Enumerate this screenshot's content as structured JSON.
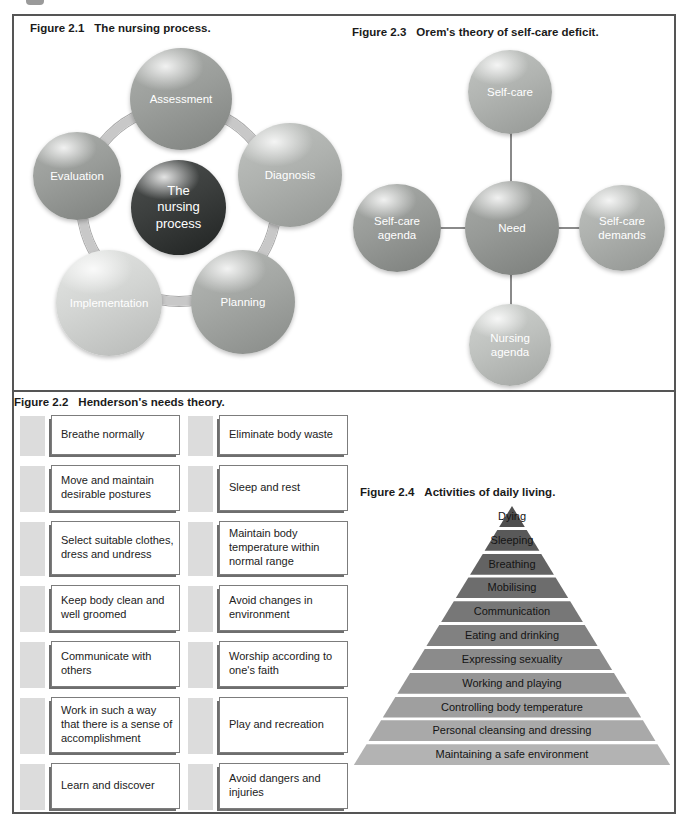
{
  "fig21": {
    "label": "Figure 2.1",
    "title": "The nursing process.",
    "ring_color": "#c8c8c8",
    "center": {
      "text": "The nursing process",
      "color": "#3c3f3e"
    },
    "nodes": [
      {
        "text": "Assessment",
        "color": "#9b9e9b"
      },
      {
        "text": "Evaluation",
        "color": "#9a9d9a"
      },
      {
        "text": "Diagnosis",
        "color": "#afb2af"
      },
      {
        "text": "Implementation",
        "color": "#d3d5d3"
      },
      {
        "text": "Planning",
        "color": "#a4a7a4"
      }
    ]
  },
  "fig23": {
    "label": "Figure 2.3",
    "title": "Orem's theory of self-care deficit.",
    "nodes": [
      {
        "text": "Self-care",
        "color": "#b1b4b1"
      },
      {
        "text": "Self-care agenda",
        "color": "#989b98"
      },
      {
        "text": "Need",
        "color": "#979a97"
      },
      {
        "text": "Self-care demands",
        "color": "#aeb1ae"
      },
      {
        "text": "Nursing agenda",
        "color": "#bfc2bf"
      }
    ]
  },
  "fig22": {
    "label": "Figure 2.2",
    "title": "Henderson's needs theory.",
    "rows": [
      {
        "left": "Breathe normally",
        "right": "Eliminate body waste"
      },
      {
        "left": "Move and maintain desirable postures",
        "right": "Sleep and rest"
      },
      {
        "left": "Select suitable clothes, dress and undress",
        "right": "Maintain body temperature within normal range"
      },
      {
        "left": "Keep body clean and well groomed",
        "right": "Avoid changes in environment"
      },
      {
        "left": "Communicate with others",
        "right": "Worship according to one's faith"
      },
      {
        "left": "Work in such a way that there is a sense of accomplishment",
        "right": "Play and recreation"
      },
      {
        "left": "Learn and discover",
        "right": "Avoid dangers and injuries"
      }
    ]
  },
  "fig24": {
    "label": "Figure 2.4",
    "title": "Activities of daily living.",
    "layers": [
      {
        "text": "Dying",
        "color": "#4f4f4f"
      },
      {
        "text": "Sleeping",
        "color": "#595959"
      },
      {
        "text": "Breathing",
        "color": "#636363"
      },
      {
        "text": "Mobilising",
        "color": "#6d6d6d"
      },
      {
        "text": "Communication",
        "color": "#777777"
      },
      {
        "text": "Eating and drinking",
        "color": "#818181"
      },
      {
        "text": "Expressing sexuality",
        "color": "#8b8b8b"
      },
      {
        "text": "Working and playing",
        "color": "#959595"
      },
      {
        "text": "Controlling body temperature",
        "color": "#9f9f9f"
      },
      {
        "text": "Personal cleansing and dressing",
        "color": "#a9a9a9"
      },
      {
        "text": "Maintaining a safe environment",
        "color": "#b3b3b3"
      }
    ]
  }
}
